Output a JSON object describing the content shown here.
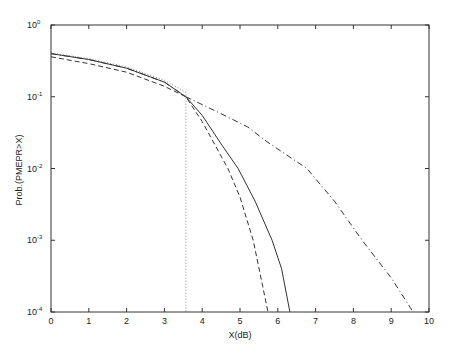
{
  "chart_data": {
    "type": "line",
    "title": "",
    "xlabel": "X(dB)",
    "ylabel": "Prob.(PMEPR>X)",
    "xlim": [
      0,
      10
    ],
    "ylim": [
      0.0001,
      1
    ],
    "yscale": "log",
    "grid": false,
    "legend": null,
    "x_ticks": [
      "0",
      "1",
      "2",
      "3",
      "4",
      "5",
      "6",
      "7",
      "8",
      "9",
      "10"
    ],
    "y_ticks": [
      {
        "base": "10",
        "exp": "0",
        "value": 1
      },
      {
        "base": "10",
        "exp": "-1",
        "value": 0.1
      },
      {
        "base": "10",
        "exp": "-2",
        "value": 0.01
      },
      {
        "base": "10",
        "exp": "-3",
        "value": 0.001
      },
      {
        "base": "10",
        "exp": "-4",
        "value": 0.0001
      }
    ],
    "series": [
      {
        "name": "solid",
        "style": "solid",
        "x": [
          0,
          1,
          2,
          3,
          3.57,
          4,
          4.5,
          4.95,
          5.4,
          5.85,
          6.1,
          6.32
        ],
        "y": [
          0.4,
          0.33,
          0.25,
          0.16,
          0.1,
          0.055,
          0.022,
          0.01,
          0.0035,
          0.001,
          0.0004,
          0.0001
        ]
      },
      {
        "name": "dashed",
        "style": "dashed",
        "x": [
          0,
          1,
          2,
          3,
          3.57,
          4,
          4.68,
          5.0,
          5.35,
          5.74
        ],
        "y": [
          0.36,
          0.29,
          0.22,
          0.14,
          0.1,
          0.045,
          0.01,
          0.004,
          0.001,
          0.0001
        ]
      },
      {
        "name": "dash-dot",
        "style": "dashdot",
        "x": [
          0,
          1,
          2,
          3,
          3.57,
          4.5,
          5.2,
          5.74,
          6.77,
          7.5,
          8.23,
          9.0,
          9.58
        ],
        "y": [
          0.4,
          0.33,
          0.25,
          0.16,
          0.1,
          0.058,
          0.038,
          0.023,
          0.01,
          0.0035,
          0.001,
          0.0003,
          0.0001
        ]
      },
      {
        "name": "dotted",
        "style": "dotted",
        "x": [
          0,
          1,
          2,
          3,
          3.57,
          3.57
        ],
        "y": [
          0.41,
          0.34,
          0.26,
          0.17,
          0.115,
          0.0001
        ]
      }
    ]
  }
}
